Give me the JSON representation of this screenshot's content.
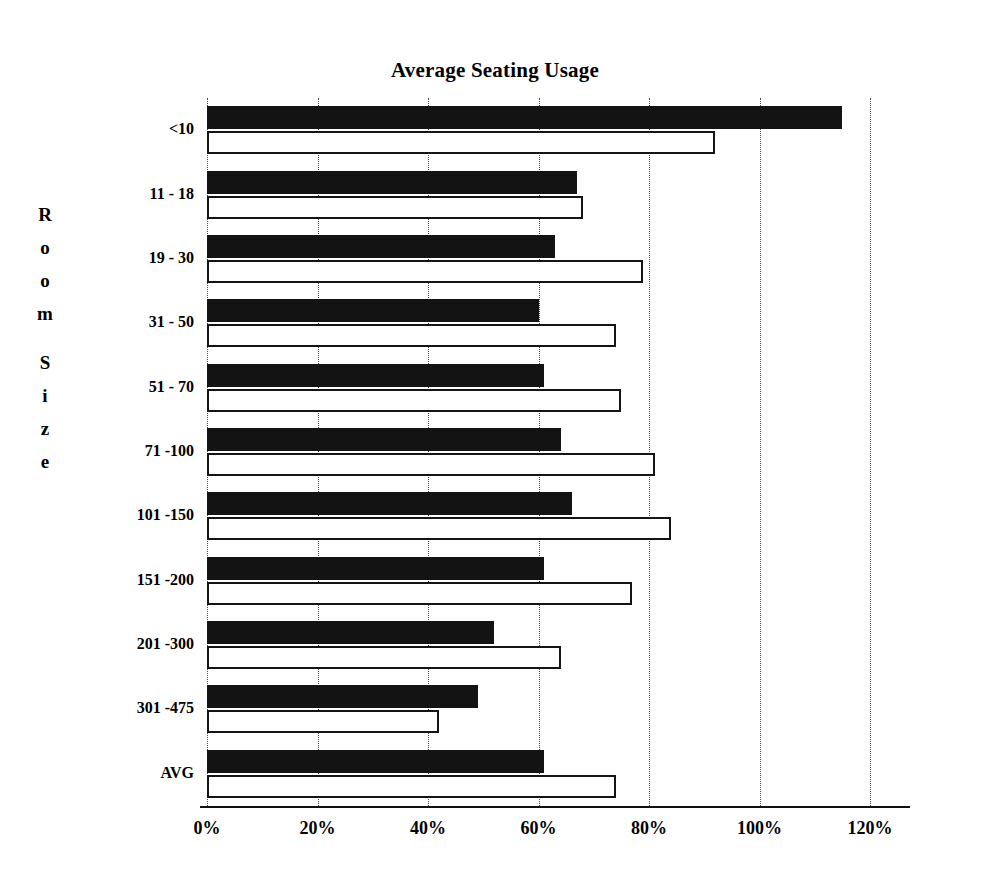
{
  "chart_data": {
    "type": "bar",
    "orientation": "horizontal",
    "title": "Average Seating Usage",
    "xlabel": "",
    "ylabel": "Room Size",
    "ylabel_chars": [
      "R",
      "o",
      "o",
      "m",
      "",
      "S",
      "i",
      "z",
      "e"
    ],
    "categories": [
      "<10",
      "11 - 18",
      "19 - 30",
      "31 - 50",
      "51 - 70",
      "71 -100",
      "101 -150",
      "151 -200",
      "201 -300",
      "301 -475",
      "AVG"
    ],
    "series": [
      {
        "name": "series-1",
        "color": "#131313",
        "style": "filled-black",
        "values": [
          115,
          67,
          63,
          60,
          61,
          64,
          66,
          61,
          52,
          49,
          61
        ]
      },
      {
        "name": "series-2",
        "color": "#ffffff",
        "style": "outlined-white",
        "values": [
          92,
          68,
          79,
          74,
          75,
          81,
          84,
          77,
          64,
          42,
          74
        ]
      }
    ],
    "xlim": [
      0,
      120
    ],
    "xticks": [
      0,
      20,
      40,
      60,
      80,
      100,
      120
    ],
    "xtick_labels": [
      "0%",
      "20%",
      "40%",
      "60%",
      "80%",
      "100%",
      "120%"
    ],
    "grid": "vertical-dotted",
    "legend": "none",
    "units": "percent"
  }
}
